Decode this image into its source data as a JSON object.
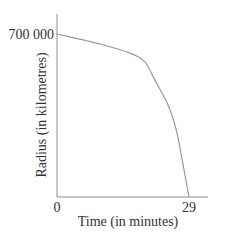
{
  "chart_data": {
    "type": "line",
    "title": "",
    "xlabel": "Time (in minutes)",
    "ylabel": "Radius (in kilometres)",
    "x_tick_labels": [
      "0",
      "29"
    ],
    "y_tick_labels": [
      "700 000"
    ],
    "xlim": [
      0,
      29
    ],
    "ylim": [
      0,
      700000
    ],
    "grid": false,
    "legend": null,
    "series": [
      {
        "name": "Radius",
        "x": [
          0,
          9.4,
          16,
          19.3,
          21.5,
          24.4,
          26.2,
          27.5,
          29
        ],
        "values": [
          700000,
          657000,
          618000,
          580000,
          502000,
          395000,
          288000,
          159000,
          0
        ]
      }
    ],
    "colors": {
      "axis": "#888888",
      "line": "#999999",
      "text": "#333333"
    }
  }
}
